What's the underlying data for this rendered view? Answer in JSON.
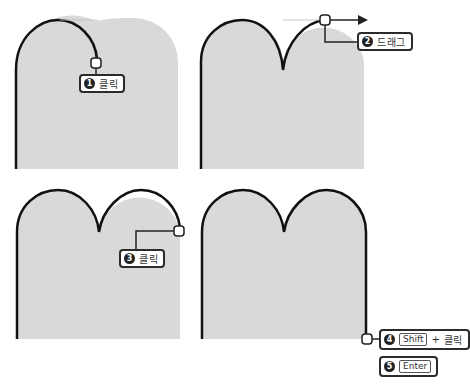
{
  "colors": {
    "shape_fill": "#d9d9d9",
    "stroke": "#111111",
    "callout_border": "#2b2b2b",
    "guide_line": "#bbbbbb"
  },
  "steps": [
    {
      "number": "1",
      "action": "클릭"
    },
    {
      "number": "2",
      "action": "드래그"
    },
    {
      "number": "3",
      "action": "클릭"
    },
    {
      "number": "4",
      "key": "Shift",
      "plus": "+",
      "action": "클릭"
    },
    {
      "number": "5",
      "key": "Enter"
    }
  ],
  "icons": {
    "anchor_point": "rounded-square-handle",
    "drag_arrow": "arrow-right"
  }
}
